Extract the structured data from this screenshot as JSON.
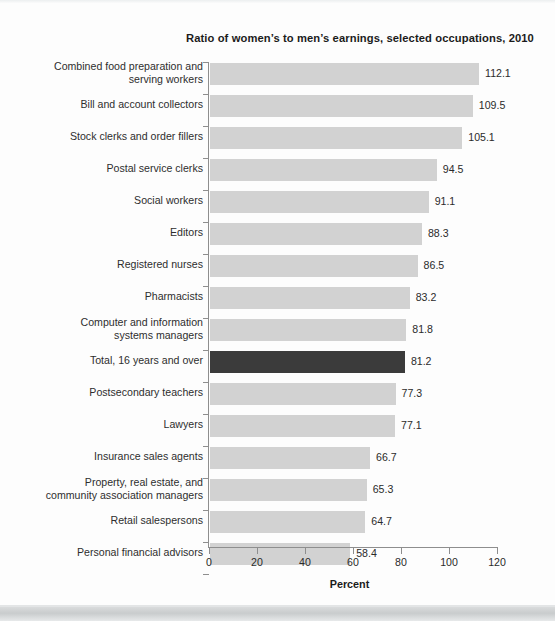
{
  "chart_data": {
    "type": "bar",
    "orientation": "horizontal",
    "title": "Ratio of women’s to men’s earnings, selected occupations, 2010",
    "xlabel": "Percent",
    "ylabel": "",
    "xlim": [
      0,
      120
    ],
    "xticks": [
      0,
      20,
      40,
      60,
      80,
      100,
      120
    ],
    "grid": false,
    "legend": null,
    "highlight_category": "Total, 16 years and over",
    "colors": {
      "bar": "#d2d2d2",
      "highlight_bar": "#3b3b3b",
      "text": "#2b2b2b",
      "axis": "#8e8e8e",
      "background": "#fdfdfd"
    },
    "categories": [
      "Combined food preparation and\nserving workers",
      "Bill and account collectors",
      "Stock clerks and order fillers",
      "Postal service clerks",
      "Social workers",
      "Editors",
      "Registered nurses",
      "Pharmacists",
      "Computer and information\nsystems managers",
      "Total, 16 years and over",
      "Postsecondary teachers",
      "Lawyers",
      "Insurance sales agents",
      "Property, real estate, and\ncommunity association managers",
      "Retail salespersons",
      "Personal financial advisors"
    ],
    "values": [
      112.1,
      109.5,
      105.1,
      94.5,
      91.1,
      88.3,
      86.5,
      83.2,
      81.8,
      81.2,
      77.3,
      77.1,
      66.7,
      65.3,
      64.7,
      58.4
    ],
    "value_labels": [
      "112.1",
      "109.5",
      "105.1",
      "94.5",
      "91.1",
      "88.3",
      "86.5",
      "83.2",
      "81.8",
      "81.2",
      "77.3",
      "77.1",
      "66.7",
      "65.3",
      "64.7",
      "58.4"
    ],
    "highlight_flags": [
      false,
      false,
      false,
      false,
      false,
      false,
      false,
      false,
      false,
      true,
      false,
      false,
      false,
      false,
      false,
      false
    ],
    "xtick_labels": [
      "0",
      "20",
      "40",
      "60",
      "80",
      "100",
      "120"
    ]
  }
}
